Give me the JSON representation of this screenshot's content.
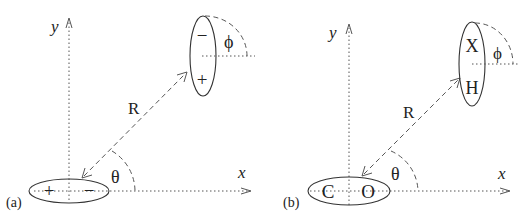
{
  "figure": {
    "panels": [
      {
        "tag": "(a)",
        "axes": {
          "x_label": "x",
          "y_label": "y"
        },
        "origin_molecule": {
          "left": "+",
          "right": "−"
        },
        "distant_molecule": {
          "top": "−",
          "bottom": "+"
        },
        "separation_label": "R",
        "polar_angle_label": "θ",
        "orientation_angle_label": "ϕ"
      },
      {
        "tag": "(b)",
        "axes": {
          "x_label": "x",
          "y_label": "y"
        },
        "origin_molecule": {
          "left": "C",
          "right": "O"
        },
        "distant_molecule": {
          "top": "X",
          "bottom": "H"
        },
        "separation_label": "R",
        "polar_angle_label": "θ",
        "orientation_angle_label": "ϕ"
      }
    ]
  }
}
